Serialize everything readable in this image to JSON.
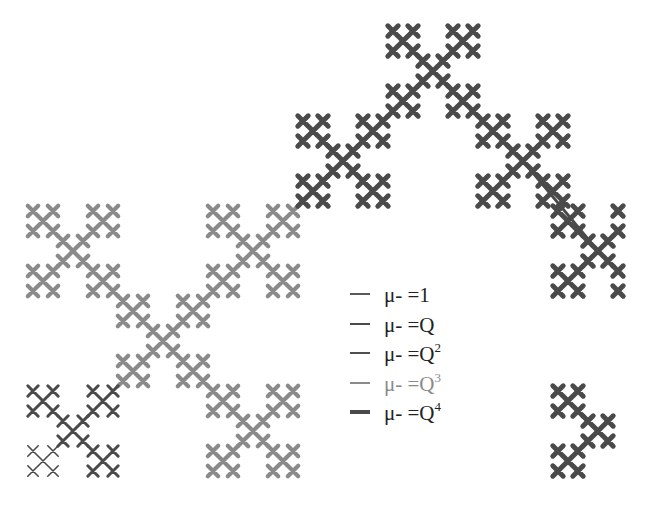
{
  "figure": {
    "type": "fractal-path-diagram",
    "cross": {
      "d2": 30,
      "d1": 10,
      "arm": 5.2
    }
  },
  "styles": {
    "mu1": {
      "color": "#5a5a5a",
      "width": 1.6
    },
    "muQ": {
      "color": "#4a4a4a",
      "width": 3.0
    },
    "muQ2": {
      "color": "#4f4f4f",
      "width": 4.0
    },
    "muQ3": {
      "color": "#8a8a8a",
      "width": 4.2
    },
    "muQ4": {
      "color": "#4a4a4a",
      "width": 5.0
    }
  },
  "clusters": [
    {
      "name": "gray-top-left",
      "cx": 73,
      "cy": 251,
      "style": "muQ3",
      "groups": "all"
    },
    {
      "name": "gray-top-right",
      "cx": 253,
      "cy": 251,
      "style": "muQ3",
      "groups": "all"
    },
    {
      "name": "gray-center",
      "cx": 163,
      "cy": 341,
      "style": "muQ3",
      "groups": "all"
    },
    {
      "name": "gray-bottom-right",
      "cx": 253,
      "cy": 431,
      "style": "muQ3",
      "groups": "all"
    },
    {
      "name": "dark-bottom-left",
      "cx": 73,
      "cy": 431,
      "style": "muQ",
      "groups": "all",
      "thin_group": "bl"
    },
    {
      "name": "dark-upper-left",
      "cx": 343,
      "cy": 161,
      "style": "muQ4",
      "groups": "all"
    },
    {
      "name": "dark-top",
      "cx": 433,
      "cy": 71,
      "style": "muQ4",
      "groups": "all"
    },
    {
      "name": "dark-upper-right",
      "cx": 523,
      "cy": 161,
      "style": "muQ4",
      "groups": "all"
    },
    {
      "name": "dark-right",
      "cx": 598,
      "cy": 251,
      "style": "muQ4",
      "groups": "partial-right"
    },
    {
      "name": "dark-bottom-right",
      "cx": 598,
      "cy": 431,
      "style": "muQ4",
      "groups": "partial-bottom-right"
    }
  ],
  "legend": {
    "items": [
      {
        "key": "mu1",
        "prefix": "μ- =",
        "base": "1",
        "sup": "",
        "text_color": "#222222"
      },
      {
        "key": "muQ",
        "prefix": "μ- =",
        "base": "Q",
        "sup": "",
        "text_color": "#222222"
      },
      {
        "key": "muQ2",
        "prefix": "μ- =",
        "base": "Q",
        "sup": "2",
        "text_color": "#222222"
      },
      {
        "key": "muQ3",
        "prefix": "μ- =",
        "base": "Q",
        "sup": "3",
        "text_color": "#8a8a8a"
      },
      {
        "key": "muQ4",
        "prefix": "μ- =",
        "base": "Q",
        "sup": "4",
        "text_color": "#222222"
      }
    ],
    "row_tops": [
      0,
      30,
      59,
      89,
      118
    ]
  }
}
